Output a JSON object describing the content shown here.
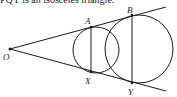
{
  "caption": "PQY is an isosceles triangle.",
  "diagram": {
    "points": {
      "O": {
        "label": "O",
        "x": 10,
        "y": 49
      },
      "A": {
        "label": "A",
        "x": 91,
        "y": 27
      },
      "X": {
        "label": "X",
        "x": 91,
        "y": 72
      },
      "B": {
        "label": "B",
        "x": 132,
        "y": 15
      },
      "Y": {
        "label": "Y",
        "x": 132,
        "y": 83
      }
    },
    "circles": [
      {
        "name": "small-circle",
        "cx": 96,
        "cy": 50,
        "r": 23
      },
      {
        "name": "large-circle",
        "cx": 139,
        "cy": 49,
        "r": 34
      }
    ],
    "stroke_color": "#1a1a1a"
  }
}
